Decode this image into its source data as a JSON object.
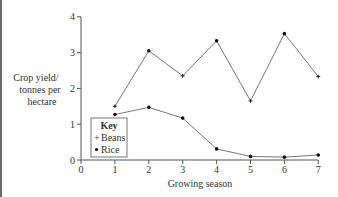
{
  "chart_data": {
    "type": "line",
    "title": "",
    "xlabel": "Growing season",
    "ylabel": [
      "Crop yield/",
      "tonnes per",
      "hectare"
    ],
    "x": [
      1,
      2,
      3,
      4,
      5,
      6,
      7
    ],
    "x_ticks": [
      "0",
      "1",
      "2",
      "3",
      "4",
      "5",
      "6",
      "7"
    ],
    "y_ticks": [
      "0",
      "1",
      "2",
      "3",
      "4"
    ],
    "xlim": [
      0,
      7
    ],
    "ylim": [
      0,
      4
    ],
    "grid": false,
    "legend_title": "Key",
    "legend_position": "inside lower left",
    "series": [
      {
        "name": "Beans",
        "marker": "+",
        "values": [
          1.5,
          3.05,
          2.35,
          3.33,
          1.65,
          3.53,
          2.33
        ]
      },
      {
        "name": "Rice",
        "marker": "•",
        "values": [
          1.27,
          1.47,
          1.17,
          0.31,
          0.1,
          0.08,
          0.14
        ]
      }
    ]
  },
  "legend": {
    "title": "Key",
    "items": [
      {
        "symbol": "+",
        "label": "Beans"
      },
      {
        "symbol": "•",
        "label": "Rice"
      }
    ]
  },
  "axes": {
    "xlabel": "Growing season",
    "ylabel_lines": [
      "Crop yield/",
      "tonnes per",
      "hectare"
    ],
    "x_tick_labels": [
      "0",
      "1",
      "2",
      "3",
      "4",
      "5",
      "6",
      "7"
    ],
    "y_tick_labels": [
      "0",
      "1",
      "2",
      "3",
      "4"
    ]
  },
  "colors": {
    "line": "#777777",
    "marker": "#111111",
    "axis": "#555555",
    "text": "#333333"
  }
}
